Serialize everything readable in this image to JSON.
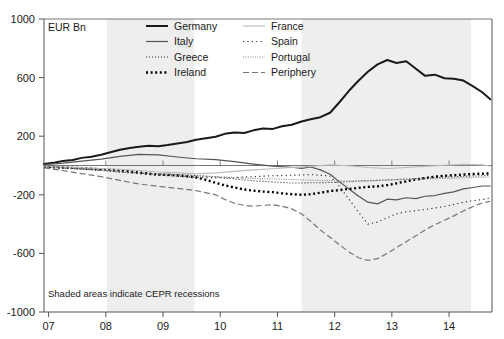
{
  "chart_data": {
    "type": "line",
    "title": "",
    "subtitle": "",
    "xlabel": "",
    "ylabel": "EUR Bn",
    "unit_label": "EUR Bn",
    "note": "Shaded areas indicate CEPR recessions",
    "grid": false,
    "legend_position": "top-center",
    "xlim": [
      2006.92,
      2014.75
    ],
    "ylim": [
      -1000,
      1000
    ],
    "yticks": [
      1000,
      600,
      200,
      -200,
      -600,
      -1000
    ],
    "ytick_labels": [
      "1000",
      "600",
      "200",
      "-200",
      "-600",
      "-1000"
    ],
    "xticks": [
      2007,
      2008,
      2009,
      2010,
      2011,
      2012,
      2013,
      2014
    ],
    "xtick_labels": [
      "07",
      "08",
      "09",
      "10",
      "11",
      "12",
      "13",
      "14"
    ],
    "zero_line": 0,
    "shaded_regions": [
      {
        "label": "CEPR recession 1",
        "x0": 2008.02,
        "x1": 2009.55,
        "color": "#eeeeee"
      },
      {
        "label": "CEPR recession 2",
        "x0": 2011.42,
        "x1": 2014.38,
        "color": "#eeeeee"
      }
    ],
    "series": [
      {
        "name": "Germany",
        "color": "#1a1a1a",
        "width": 2.0,
        "dash": "none",
        "x": [
          2006.92,
          2007.08,
          2007.25,
          2007.42,
          2007.58,
          2007.75,
          2007.92,
          2008.08,
          2008.25,
          2008.42,
          2008.58,
          2008.75,
          2008.92,
          2009.08,
          2009.25,
          2009.42,
          2009.58,
          2009.75,
          2009.92,
          2010.08,
          2010.25,
          2010.42,
          2010.58,
          2010.75,
          2010.92,
          2011.08,
          2011.25,
          2011.42,
          2011.58,
          2011.75,
          2011.92,
          2012.08,
          2012.25,
          2012.42,
          2012.58,
          2012.75,
          2012.92,
          2013.08,
          2013.25,
          2013.42,
          2013.58,
          2013.75,
          2013.92,
          2014.08,
          2014.25,
          2014.42,
          2014.58,
          2014.72
        ],
        "y": [
          10,
          18,
          30,
          38,
          52,
          60,
          74,
          90,
          108,
          120,
          128,
          134,
          132,
          140,
          150,
          160,
          176,
          186,
          196,
          216,
          226,
          222,
          240,
          252,
          250,
          268,
          278,
          300,
          316,
          330,
          360,
          430,
          510,
          580,
          640,
          690,
          720,
          700,
          712,
          660,
          612,
          620,
          596,
          592,
          580,
          540,
          500,
          452
        ]
      },
      {
        "name": "Italy",
        "color": "#555555",
        "width": 1.2,
        "dash": "none",
        "x": [
          2006.92,
          2007.25,
          2007.58,
          2007.92,
          2008.25,
          2008.58,
          2008.92,
          2009.25,
          2009.58,
          2009.92,
          2010.25,
          2010.58,
          2010.92,
          2011.25,
          2011.42,
          2011.58,
          2011.75,
          2011.92,
          2012.08,
          2012.25,
          2012.42,
          2012.58,
          2012.75,
          2012.92,
          2013.08,
          2013.25,
          2013.42,
          2013.58,
          2013.75,
          2013.92,
          2014.08,
          2014.25,
          2014.42,
          2014.58,
          2014.72
        ],
        "y": [
          6,
          16,
          30,
          44,
          62,
          76,
          72,
          58,
          46,
          40,
          26,
          10,
          -4,
          -12,
          -20,
          -10,
          -30,
          -60,
          -110,
          -160,
          -210,
          -250,
          -262,
          -230,
          -235,
          -220,
          -226,
          -210,
          -205,
          -190,
          -180,
          -160,
          -150,
          -140,
          -140
        ]
      },
      {
        "name": "Greece",
        "color": "#222222",
        "width": 1.1,
        "dash": "1,2",
        "x": [
          2006.92,
          2007.25,
          2007.58,
          2007.92,
          2008.25,
          2008.58,
          2008.92,
          2009.25,
          2009.58,
          2009.92,
          2010.25,
          2010.58,
          2010.92,
          2011.25,
          2011.58,
          2011.92,
          2012.25,
          2012.58,
          2012.92,
          2013.25,
          2013.58,
          2013.92,
          2014.25,
          2014.58,
          2014.72
        ],
        "y": [
          -10,
          -18,
          -26,
          -34,
          -44,
          -52,
          -58,
          -62,
          -68,
          -78,
          -92,
          -104,
          -112,
          -120,
          -118,
          -116,
          -110,
          -104,
          -98,
          -92,
          -86,
          -80,
          -74,
          -70,
          -66
        ]
      },
      {
        "name": "Ireland",
        "color": "#000000",
        "width": 2.4,
        "dash": "2,2.6",
        "x": [
          2006.92,
          2007.08,
          2007.25,
          2007.42,
          2007.58,
          2007.75,
          2007.92,
          2008.08,
          2008.25,
          2008.42,
          2008.58,
          2008.75,
          2008.92,
          2009.08,
          2009.25,
          2009.42,
          2009.58,
          2009.75,
          2009.92,
          2010.08,
          2010.25,
          2010.42,
          2010.58,
          2010.75,
          2010.92,
          2011.08,
          2011.25,
          2011.42,
          2011.58,
          2011.75,
          2011.92,
          2012.08,
          2012.25,
          2012.42,
          2012.58,
          2012.75,
          2012.92,
          2013.08,
          2013.25,
          2013.42,
          2013.58,
          2013.75,
          2013.92,
          2014.08,
          2014.25,
          2014.42,
          2014.58,
          2014.72
        ],
        "y": [
          -8,
          -12,
          -14,
          -16,
          -18,
          -22,
          -26,
          -30,
          -34,
          -40,
          -48,
          -56,
          -62,
          -64,
          -68,
          -74,
          -82,
          -98,
          -118,
          -136,
          -150,
          -164,
          -172,
          -178,
          -182,
          -190,
          -196,
          -200,
          -196,
          -186,
          -174,
          -168,
          -160,
          -152,
          -146,
          -142,
          -134,
          -122,
          -108,
          -96,
          -86,
          -76,
          -70,
          -66,
          -62,
          -58,
          -56,
          -54
        ]
      },
      {
        "name": "France",
        "color": "#bbbbbb",
        "width": 1.1,
        "dash": "none",
        "x": [
          2006.92,
          2007.25,
          2007.58,
          2007.92,
          2008.25,
          2008.58,
          2008.92,
          2009.25,
          2009.58,
          2009.92,
          2010.25,
          2010.58,
          2010.92,
          2011.25,
          2011.58,
          2011.92,
          2012.25,
          2012.58,
          2012.92,
          2013.25,
          2013.58,
          2013.92,
          2014.25,
          2014.58,
          2014.72
        ],
        "y": [
          -4,
          -10,
          -16,
          -20,
          -26,
          -34,
          -44,
          -50,
          -56,
          -50,
          -40,
          -30,
          -22,
          -14,
          -6,
          4,
          -2,
          -14,
          -20,
          -14,
          -6,
          2,
          8,
          4,
          -4
        ]
      },
      {
        "name": "Spain",
        "color": "#333333",
        "width": 1.2,
        "dash": "1.2,3.2",
        "x": [
          2006.92,
          2007.25,
          2007.58,
          2007.92,
          2008.25,
          2008.58,
          2008.92,
          2009.25,
          2009.58,
          2009.92,
          2010.25,
          2010.58,
          2010.92,
          2011.25,
          2011.58,
          2011.92,
          2012.08,
          2012.25,
          2012.42,
          2012.58,
          2012.75,
          2012.92,
          2013.08,
          2013.25,
          2013.58,
          2013.92,
          2014.25,
          2014.58,
          2014.72
        ],
        "y": [
          -6,
          -14,
          -22,
          -30,
          -44,
          -56,
          -66,
          -72,
          -80,
          -84,
          -82,
          -76,
          -70,
          -66,
          -62,
          -72,
          -140,
          -230,
          -320,
          -400,
          -386,
          -356,
          -330,
          -316,
          -300,
          -280,
          -250,
          -232,
          -222
        ]
      },
      {
        "name": "Portugal",
        "color": "#888888",
        "width": 1.1,
        "dash": "1,1.4",
        "x": [
          2006.92,
          2007.25,
          2007.58,
          2007.92,
          2008.25,
          2008.58,
          2008.92,
          2009.25,
          2009.58,
          2009.92,
          2010.25,
          2010.58,
          2010.92,
          2011.25,
          2011.58,
          2011.92,
          2012.25,
          2012.58,
          2012.92,
          2013.25,
          2013.58,
          2013.92,
          2014.25,
          2014.58,
          2014.72
        ],
        "y": [
          -8,
          -16,
          -24,
          -32,
          -40,
          -50,
          -58,
          -64,
          -70,
          -76,
          -82,
          -88,
          -92,
          -96,
          -100,
          -104,
          -106,
          -104,
          -100,
          -96,
          -92,
          -88,
          -84,
          -80,
          -78
        ]
      },
      {
        "name": "Periphery",
        "color": "#777777",
        "width": 1.2,
        "dash": "6,3",
        "x": [
          2006.92,
          2007.25,
          2007.58,
          2007.92,
          2008.25,
          2008.58,
          2008.92,
          2009.25,
          2009.58,
          2009.92,
          2010.08,
          2010.25,
          2010.42,
          2010.58,
          2010.75,
          2010.92,
          2011.08,
          2011.25,
          2011.42,
          2011.58,
          2011.75,
          2011.92,
          2012.08,
          2012.25,
          2012.42,
          2012.58,
          2012.75,
          2012.92,
          2013.08,
          2013.25,
          2013.42,
          2013.58,
          2013.75,
          2013.92,
          2014.08,
          2014.25,
          2014.42,
          2014.58,
          2014.72
        ],
        "y": [
          -16,
          -34,
          -56,
          -76,
          -102,
          -126,
          -142,
          -156,
          -172,
          -200,
          -232,
          -258,
          -272,
          -278,
          -272,
          -268,
          -278,
          -296,
          -330,
          -380,
          -440,
          -490,
          -540,
          -590,
          -630,
          -648,
          -636,
          -600,
          -560,
          -520,
          -480,
          -440,
          -404,
          -374,
          -344,
          -310,
          -280,
          -256,
          -244
        ]
      }
    ]
  },
  "legend": {
    "items": [
      {
        "label": "Germany",
        "key": "Germany"
      },
      {
        "label": "France",
        "key": "France"
      },
      {
        "label": "Italy",
        "key": "Italy"
      },
      {
        "label": "Spain",
        "key": "Spain"
      },
      {
        "label": "Greece",
        "key": "Greece"
      },
      {
        "label": "Portugal",
        "key": "Portugal"
      },
      {
        "label": "Ireland",
        "key": "Ireland"
      },
      {
        "label": "Periphery",
        "key": "Periphery"
      }
    ]
  },
  "colors": {
    "background": "#ffffff",
    "shade": "#eeeeee",
    "axis": "#555555",
    "text": "#1a1a1a"
  }
}
